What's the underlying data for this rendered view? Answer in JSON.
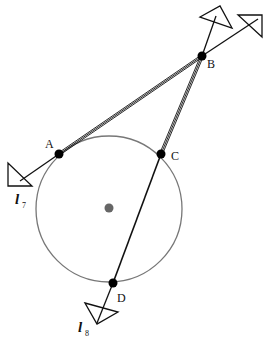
{
  "diagram": {
    "type": "geometry-construction",
    "colors": {
      "line": "#111111",
      "circle": "#777777",
      "center": "#666666",
      "point": "#000000"
    },
    "circle": {
      "cx": 109,
      "cy": 209,
      "r": 73
    },
    "center_point": {
      "x": 109,
      "y": 208
    },
    "points": [
      {
        "id": "A",
        "label": "A",
        "x": 59,
        "y": 154,
        "lx": 46,
        "ly": 147
      },
      {
        "id": "B",
        "label": "B",
        "x": 202,
        "y": 56,
        "lx": 207,
        "ly": 68
      },
      {
        "id": "C",
        "label": "C",
        "x": 161,
        "y": 154,
        "lx": 172,
        "ly": 159
      },
      {
        "id": "D",
        "label": "D",
        "x": 113,
        "y": 283,
        "lx": 117,
        "ly": 301
      }
    ],
    "lines": [
      {
        "id": "l7",
        "name": "l",
        "subscript": "7",
        "through": [
          "A",
          "B"
        ]
      },
      {
        "id": "l8",
        "name": "l",
        "subscript": "8",
        "through": [
          "B",
          "D"
        ]
      }
    ],
    "segments": [
      {
        "from": "A",
        "to": "B",
        "style": "triple"
      },
      {
        "from": "B",
        "to": "C",
        "style": "triple"
      },
      {
        "from": "C",
        "to": "D",
        "style": "single"
      }
    ],
    "line_labels": {
      "l7": {
        "main": "l",
        "sub": "7"
      },
      "l8": {
        "main": "l",
        "sub": "8"
      }
    }
  }
}
